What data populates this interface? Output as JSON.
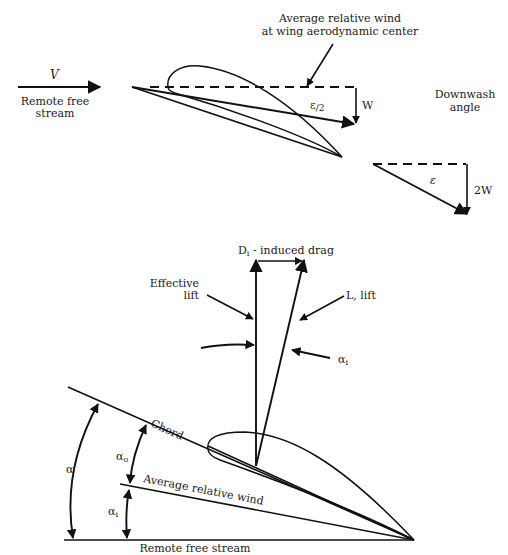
{
  "top_diagram": {
    "velocity_label": "V",
    "remote_free_stream_line1": "Remote free",
    "remote_free_stream_line2": "stream",
    "avg_wind_line1": "Average relative wind",
    "avg_wind_line2": "at wing aerodynamic center",
    "epsilon_half": "ε",
    "epsilon_half_sub": "/2",
    "w_label": "W",
    "downwash_line1": "Downwash",
    "downwash_line2": "angle",
    "epsilon": "ε",
    "two_w_label": "2W"
  },
  "bottom_diagram": {
    "induced_drag": "D",
    "induced_drag_sub": "i",
    "induced_drag_rest": " - induced drag",
    "effective_lift_line1": "Effective",
    "effective_lift_line2": "lift",
    "lift_label": "L, lift",
    "alpha_i_top": "α",
    "alpha_i_top_sub": "i",
    "chord_label": "Chord",
    "alpha_label": "α",
    "alpha_o": "α",
    "alpha_o_sub": "o",
    "alpha_i": "α",
    "alpha_i_sub": "i",
    "average_relative_wind": "Average relative wind",
    "remote_free_stream": "Remote free stream"
  }
}
